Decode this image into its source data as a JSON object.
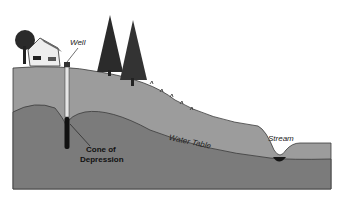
{
  "diagram": {
    "type": "groundwater cross-section",
    "labels": {
      "well": "Well",
      "water_table": "Water Table",
      "stream": "Stream",
      "cone_line1": "Cone of",
      "cone_line2": "Depression"
    },
    "colors": {
      "background": "#ffffff",
      "unsaturated_zone": "#9a9a9a",
      "saturated_zone": "#7a7a7a",
      "outline": "#3a3a3a",
      "well_casing": "#e8e8e8",
      "well_screen": "#111111",
      "stream_water": "#1a1a1a",
      "trees": "#2a2a2a",
      "house": "#eeeeee"
    }
  }
}
